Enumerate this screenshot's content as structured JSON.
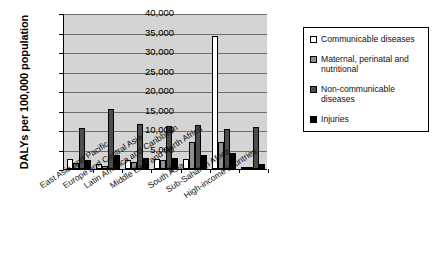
{
  "chart_data": {
    "type": "bar",
    "title": "",
    "xlabel": "",
    "ylabel": "DALYs per 100,000 population",
    "ylim": [
      0,
      40000
    ],
    "ytick_labels": [
      "40,000",
      "35,000",
      "30,000",
      "25,000",
      "20,000",
      "15,000",
      "10,000",
      "5,000",
      "0"
    ],
    "ytick_values": [
      40000,
      35000,
      30000,
      25000,
      20000,
      15000,
      10000,
      5000,
      0
    ],
    "grid": true,
    "legend_position": "right",
    "categories": [
      "East Asia and Pacific",
      "Europe and Central Asia",
      "Latin America and Caribbean",
      "Middle East and North Africa",
      "South Asia",
      "Sub-Saharan Africa",
      "High-income countries"
    ],
    "series": [
      {
        "name": "Communicable diseases",
        "color": "#ffffff",
        "values": [
          2500,
          1300,
          2400,
          2600,
          2600,
          34000,
          600
        ]
      },
      {
        "name": "Maternal, perinatal and nutritional",
        "color": "#8f8f8f",
        "values": [
          1500,
          800,
          1900,
          2300,
          7000,
          6800,
          200
        ]
      },
      {
        "name": "Non-communicable diseases",
        "color": "#4d4d4d",
        "values": [
          10500,
          15300,
          11500,
          11000,
          11200,
          10200,
          10900
        ]
      },
      {
        "name": "Injuries",
        "color": "#000000",
        "values": [
          2400,
          3600,
          2800,
          2700,
          3700,
          4000,
          1200
        ]
      }
    ]
  },
  "legend": {
    "entries": [
      {
        "label": "Communicable diseases",
        "swatch": "c0"
      },
      {
        "label": "Maternal, perinatal and nutritional",
        "swatch": "c1"
      },
      {
        "label": "Non-communicable diseases",
        "swatch": "c2"
      },
      {
        "label": "Injuries",
        "swatch": "c3"
      }
    ]
  }
}
